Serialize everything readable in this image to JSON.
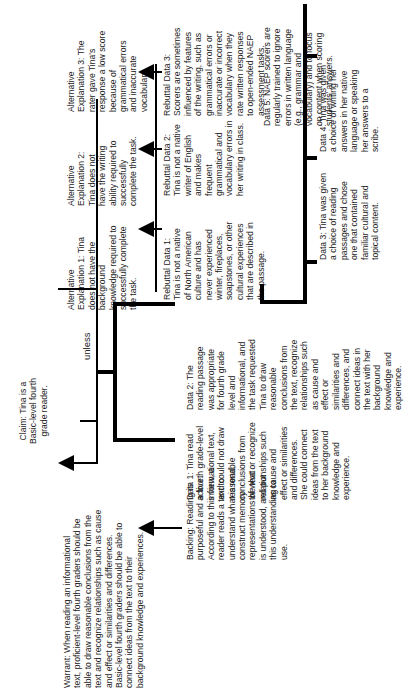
{
  "claim": {
    "text": "Claim:  Tina is a\nBasic-level fourth\ngrade reader."
  },
  "warrant": {
    "text": "Warrant:  When reading an informational\ntext, proficient-level fourth graders should be\nable to draw reasonable conclusions from the\ntext and recognize relationships such as cause\nand effect or similarities and differences.\nBasic-level fourth graders should be able to\nconnect ideas from the text to their\nbackground knowledge and experiences."
  },
  "backing": {
    "text": "Backing:  Reading is\npurposeful and active.\nAccording to this view, a\nreader reads a text to\nunderstand what is read,\nconstruct memory\nrepresentations of what\nis understood, and put\nthis understanding to\nuse."
  },
  "data1": {
    "text": "Data 1:  Tina read\na fourth grade-level\ninformational text,\nand could not draw\nreasonable\nconclusions from\nthe text or recognize\nrelationships such\nas cause and\neffect or similarities\nand differences.\nShe could connect\nideas from the text\nto her background\nknowledge and\nexperience."
  },
  "data2": {
    "text": "Data 2:  The\nreading passage\nwas appropriate\nfor fourth grade\nlevel and\ninformational, and\nthe task requested\nTina to draw\nreasonable\nconclusions from\nthe text, recognize\nrelationships such\nas cause and\neffect or\nsimilarities and\ndifferences, and\nconnect ideas in\nthe text with her\nbackground\nknowledge and\nexperience."
  },
  "unless": {
    "text": "unless"
  },
  "alternatives": [
    {
      "text": "Alternative\nExplanation 1:  Tina\ndoes not have the\nbackground\nknowledge required to\nsuccessfully complete\nthe task."
    },
    {
      "text": "Alternative\nExplanation 2:\nTina does not\nhave the writing\nability required to\nsuccessfully\ncomplete the task."
    },
    {
      "text": "Alternative\nExplanation 3:  The\nrater gave Tina's\nresponse a low score\nbecause of\ngrammatical errors\nand inaccurate\nvocabulary."
    }
  ],
  "rebuttals": [
    {
      "text": "Rebuttal Data 1:\nTina is not a native\nof North American\nculture and has\nnever experienced\nwinter, fireplaces,\nsoapstones, or other\ncultural experiences\nthat are described in\nthe passage."
    },
    {
      "text": "Rebuttal Data 2:\nTina is not a native\nwriter of English\nand makes\nfrequent\ngrammatical and\nvocabulary errors in\nher writing in class."
    },
    {
      "text": "Rebuttal Data 3:\nScorers are sometimes\ninfluenced by features\nof the writing, such as\ngrammatical errors or\ninaccurate or incorrect\nvocabulary when they\nrate written responses\nto  open-ended NAEP\nassessment tasks."
    }
  ],
  "counter_data": [
    {
      "text": "Data 3:  Tina was given\na choice of reading\npassages and chose\none that contained\nfamiliar cultural and\ntopical content."
    },
    {
      "text": "Data 4:  Tina was given\na choice of writing her\nanswers in her native\nlanguage or speaking\nher answers to a\nscribe."
    },
    {
      "text": "Data 5:  NAEP scorers are\nregularly trained to ignore\nerrors in written language\n(e.g., grammar and\nvocabulary) and to focus\non content when scoring\nstudents' answers."
    }
  ]
}
